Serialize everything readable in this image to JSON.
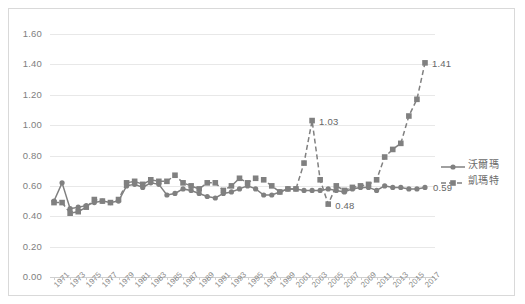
{
  "chart_data": {
    "type": "line",
    "title": "",
    "xlabel": "",
    "ylabel": "",
    "ylim": [
      0.0,
      1.6
    ],
    "ytick_step": 0.2,
    "ytick_labels": [
      "0.00",
      "0.20",
      "0.40",
      "0.60",
      "0.80",
      "1.00",
      "1.20",
      "1.40",
      "1.60"
    ],
    "grid": true,
    "legend_position": "right",
    "x_label_interval": 2,
    "x": [
      1971,
      1972,
      1973,
      1974,
      1975,
      1976,
      1977,
      1978,
      1979,
      1980,
      1981,
      1982,
      1983,
      1984,
      1985,
      1986,
      1987,
      1988,
      1989,
      1990,
      1991,
      1992,
      1993,
      1994,
      1995,
      1996,
      1997,
      1998,
      1999,
      2000,
      2001,
      2002,
      2003,
      2004,
      2005,
      2006,
      2007,
      2008,
      2009,
      2010,
      2011,
      2012,
      2013,
      2014,
      2015,
      2016,
      2017
    ],
    "xtick_labels": [
      "1971",
      "1973",
      "1975",
      "1977",
      "1979",
      "1981",
      "1983",
      "1985",
      "1987",
      "1989",
      "1991",
      "1993",
      "1995",
      "1997",
      "1999",
      "2001",
      "2003",
      "2005",
      "2007",
      "2009",
      "2011",
      "2013",
      "2015",
      "2017"
    ],
    "series": [
      {
        "name": "沃爾瑪",
        "marker": "circle",
        "linestyle": "solid",
        "color": "#808080",
        "values": [
          0.5,
          0.62,
          0.45,
          0.46,
          0.47,
          0.49,
          0.5,
          0.49,
          0.5,
          0.6,
          0.61,
          0.59,
          0.62,
          0.61,
          0.54,
          0.55,
          0.58,
          0.57,
          0.55,
          0.53,
          0.52,
          0.55,
          0.56,
          0.58,
          0.6,
          0.58,
          0.54,
          0.54,
          0.56,
          0.58,
          0.58,
          0.57,
          0.57,
          0.57,
          0.58,
          0.57,
          0.56,
          0.58,
          0.59,
          0.59,
          0.57,
          0.6,
          0.59,
          0.59,
          0.58,
          0.58,
          0.59
        ]
      },
      {
        "name": "凱瑪特",
        "marker": "square",
        "linestyle": "dashed",
        "color": "#808080",
        "values": [
          0.49,
          0.49,
          0.42,
          0.43,
          0.46,
          0.51,
          0.5,
          0.49,
          0.51,
          0.62,
          0.63,
          0.61,
          0.64,
          0.63,
          0.63,
          0.67,
          0.62,
          0.6,
          0.58,
          0.62,
          0.62,
          0.57,
          0.6,
          0.65,
          0.62,
          0.65,
          0.64,
          0.6,
          0.56,
          0.58,
          0.58,
          0.75,
          1.03,
          0.64,
          0.48,
          0.6,
          0.57,
          0.59,
          0.6,
          0.61,
          0.64,
          0.79,
          0.84,
          0.88,
          1.06,
          1.17,
          1.41
        ]
      }
    ],
    "point_labels": [
      {
        "series": "凱瑪特",
        "year": 2003,
        "text": "1.03"
      },
      {
        "series": "凱瑪特",
        "year": 2005,
        "text": "0.48"
      },
      {
        "series": "凱瑪特",
        "year": 2017,
        "text": "1.41"
      },
      {
        "series": "沃爾瑪",
        "year": 2017,
        "text": "0.59"
      }
    ]
  },
  "legend": {
    "items": [
      {
        "label": "沃爾瑪",
        "style": "solid"
      },
      {
        "label": "凱瑪特",
        "style": "dashed"
      }
    ]
  }
}
